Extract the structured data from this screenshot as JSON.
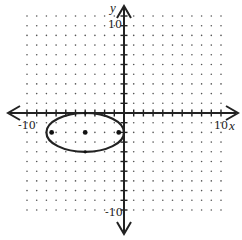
{
  "chart_data": {
    "type": "scatter",
    "title": "",
    "xlabel": "x",
    "ylabel": "y",
    "xlim": [
      -10,
      10
    ],
    "ylim": [
      -10,
      10
    ],
    "grid": "dots",
    "tick_labels": {
      "x_min": "-10",
      "x_max": "10",
      "y_min": "-10",
      "y_max": "10"
    },
    "ellipse": {
      "center": [
        -4,
        -2
      ],
      "semi_major_x": 4,
      "semi_minor_y": 2
    },
    "points": [
      {
        "label": "center",
        "x": -4,
        "y": -2
      },
      {
        "label": "focus-left",
        "x": -7.46,
        "y": -2
      },
      {
        "label": "focus-right",
        "x": -0.54,
        "y": -2
      },
      {
        "label": "co-vertex-top",
        "x": -4,
        "y": 0
      },
      {
        "label": "co-vertex-bottom",
        "x": -4,
        "y": -4
      }
    ]
  },
  "labels": {
    "x_axis": "x",
    "y_axis": "y",
    "x_neg": "-10",
    "x_pos": "10",
    "y_pos": "10",
    "y_neg": "-10"
  }
}
